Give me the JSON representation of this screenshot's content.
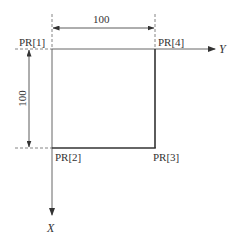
{
  "diagram": {
    "points": {
      "pr1": "PR[1]",
      "pr2": "PR[2]",
      "pr3": "PR[3]",
      "pr4": "PR[4]"
    },
    "axes": {
      "y_label": "Y",
      "x_label": "X"
    },
    "dimensions": {
      "horizontal": "100",
      "vertical": "100"
    },
    "colors": {
      "line": "#333333",
      "thin_line": "#555555",
      "background": "#ffffff"
    }
  }
}
